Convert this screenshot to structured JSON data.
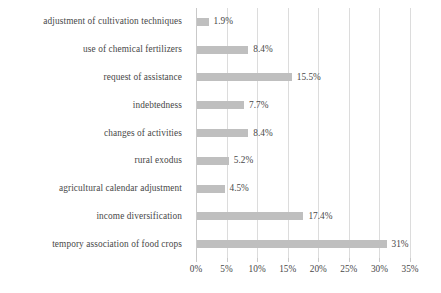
{
  "chart_data": {
    "type": "bar",
    "orientation": "horizontal",
    "title": "",
    "subtitle": "",
    "xlabel": "",
    "ylabel": "",
    "xlim": [
      0,
      35
    ],
    "grid": true,
    "legend": false,
    "legend_position": "none",
    "bar_color": "#bfbfbf",
    "gridline_color": "#dcdcdc",
    "text_color": "#484848",
    "xtick_labels": [
      "0%",
      "5%",
      "10%",
      "15%",
      "20%",
      "25%",
      "30%",
      "35%"
    ],
    "xtick_values": [
      0,
      5,
      10,
      15,
      20,
      25,
      30,
      35
    ],
    "categories": [
      "adjustment of cultivation techniques",
      "use of chemical fertilizers",
      "request of assistance",
      "indebtedness",
      "changes of activities",
      "rural exodus",
      "agricultural calendar adjustment",
      "income diversification",
      "tempory association of food crops"
    ],
    "values": [
      1.9,
      8.4,
      15.5,
      7.7,
      8.4,
      5.2,
      4.5,
      17.4,
      31
    ],
    "value_labels": [
      "1.9%",
      "8.4%",
      "15.5%",
      "7.7%",
      "8.4%",
      "5.2%",
      "4.5%",
      "17.4%",
      "31%"
    ]
  }
}
